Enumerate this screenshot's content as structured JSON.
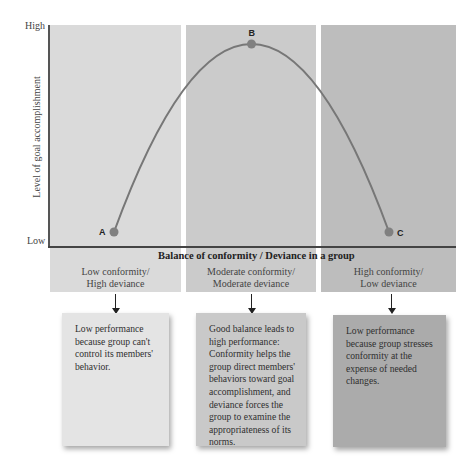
{
  "diagram": {
    "y_axis": {
      "title": "Level of goal accomplishment",
      "high_label": "High",
      "low_label": "Low"
    },
    "x_axis": {
      "title": "Balance of conformity / Deviance in a group"
    },
    "columns": [
      {
        "label_line1": "Low conformity/",
        "label_line2": "High deviance",
        "color": "#dadada"
      },
      {
        "label_line1": "Moderate conformity/",
        "label_line2": "Moderate deviance",
        "color": "#cbcbcb"
      },
      {
        "label_line1": "High conformity/",
        "label_line2": "Low deviance",
        "color": "#bdbdbd"
      }
    ],
    "notes": [
      {
        "text": "Low performance because group can't control its members' behavior.",
        "color": "#e4e4e4"
      },
      {
        "text": "Good balance leads to high performance: Conformity helps the group direct members' behaviors toward goal accomplishment, and deviance forces the group to examine the appropriateness of its norms.",
        "color": "#c9c9c9"
      },
      {
        "text": "Low performance because group stresses conformity at the expense of needed changes.",
        "color": "#ababab"
      }
    ],
    "curve_color": "#777777",
    "point_color": "#808080"
  },
  "chart_data": {
    "type": "line",
    "title": "",
    "xlabel": "Balance of conformity / Deviance in a group",
    "ylabel": "Level of goal accomplishment",
    "categories": [
      "Low conformity/High deviance",
      "Moderate conformity/Moderate deviance",
      "High conformity/Low deviance"
    ],
    "points": [
      {
        "label": "A",
        "x": 0,
        "y": 0
      },
      {
        "label": "B",
        "x": 0.5,
        "y": 1
      },
      {
        "label": "C",
        "x": 1,
        "y": 0
      }
    ],
    "ylim": [
      "Low",
      "High"
    ],
    "curve": "inverted-U",
    "grid": false
  }
}
